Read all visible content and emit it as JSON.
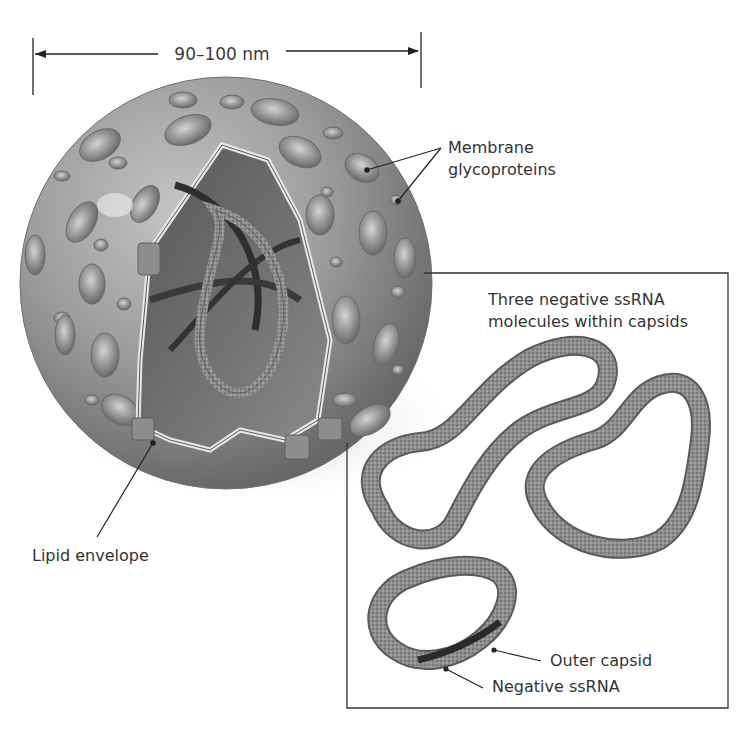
{
  "diagram": {
    "scale_bar": {
      "label": "90–100 nm",
      "x_start": 33,
      "x_end": 421,
      "y": 54
    },
    "labels": {
      "membrane_glycoproteins": [
        "Membrane",
        "glycoproteins"
      ],
      "lipid_envelope": "Lipid envelope",
      "inset_title": [
        "Three negative ssRNA",
        "molecules within capsids"
      ],
      "outer_capsid": "Outer capsid",
      "negative_ssrna": "Negative ssRNA"
    },
    "inset_box": {
      "left": 347,
      "top": 273,
      "right": 728,
      "bottom": 708,
      "notch_x": 424,
      "notch_y": 443
    },
    "colors": {
      "background": "#ffffff",
      "virus_surface": "#9a9a9a",
      "virus_shadow": "#5e5e5e",
      "glycoprotein": "#8a8a8a",
      "interior": "#6f6f6f",
      "capsid_strand": "#8c8c8c",
      "rna_core": "#2e2e2e",
      "line": "#222222",
      "text": "#333333"
    }
  }
}
